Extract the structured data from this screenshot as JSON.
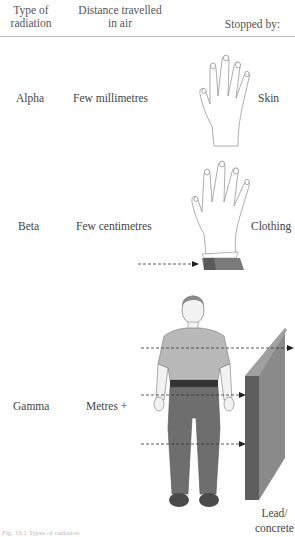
{
  "header": {
    "col1": [
      "Type of",
      "radiation"
    ],
    "col2": [
      "Distance travelled",
      "in air"
    ],
    "col3": "Stopped by:"
  },
  "rows": [
    {
      "type": "Alpha",
      "distance": "Few millimetres",
      "stopped_by": "Skin",
      "illustration": "hand-icon"
    },
    {
      "type": "Beta",
      "distance": "Few centimetres",
      "stopped_by": "Clothing",
      "illustration": "hand-with-sleeve-icon"
    },
    {
      "type": "Gamma",
      "distance": "Metres +",
      "stopped_by_lines": [
        "Lead/",
        "concrete"
      ],
      "illustration": "person-and-lead-wall-icon"
    }
  ],
  "caption": "Fig. 19.1 Types of radiation",
  "colors": {
    "text": "#4a4a4a",
    "rule": "#bdbdbd",
    "shirt": "#b9b9b9",
    "trousers": "#6e6e6e",
    "wall_front": "#8a8a8a",
    "wall_side": "#5e5e5e",
    "sleeve": "#7a7a7a",
    "arrow": "#333333"
  }
}
